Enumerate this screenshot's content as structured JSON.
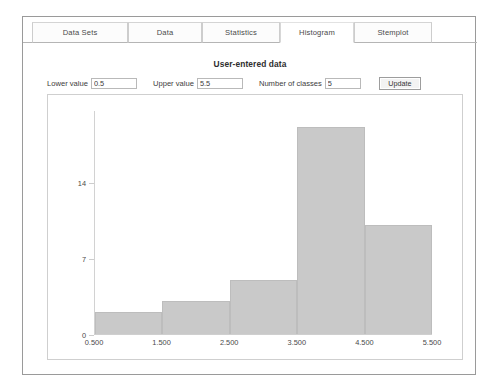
{
  "window": {
    "title": ""
  },
  "tabs": [
    {
      "label": "Data Sets",
      "active": false
    },
    {
      "label": "Data",
      "active": false
    },
    {
      "label": "Statistics",
      "active": false
    },
    {
      "label": "Histogram",
      "active": true
    },
    {
      "label": "Stemplot",
      "active": false
    }
  ],
  "panel": {
    "title": "User-entered data"
  },
  "controls": {
    "lower_label": "Lower value",
    "lower_value": "0.5",
    "upper_label": "Upper value",
    "upper_value": "5.5",
    "classes_label": "Number of classes",
    "classes_value": "5",
    "update_label": "Update"
  },
  "colors": {
    "bar_fill": "#c9c9c9",
    "bar_border": "#bdbdbd",
    "axis": "#cfcfcf",
    "frame": "#9a9a9a",
    "panel_border": "#cfcfcf",
    "text": "#3a3a3a"
  },
  "chart_data": {
    "type": "bar",
    "title": "User-entered data",
    "xlabel": "",
    "ylabel": "",
    "categories": [
      "0.500-1.500",
      "1.500-2.500",
      "2.500-3.500",
      "3.500-4.500",
      "4.500-5.500"
    ],
    "bin_edges": [
      0.5,
      1.5,
      2.5,
      3.5,
      4.5,
      5.5
    ],
    "values": [
      2,
      3,
      5,
      19,
      10
    ],
    "xtick_labels": [
      "0.500",
      "1.500",
      "2.500",
      "3.500",
      "4.500",
      "5.500"
    ],
    "ytick_labels": [
      "0",
      "7",
      "14"
    ],
    "yticks": [
      0,
      7,
      14
    ],
    "xlim": [
      0.5,
      5.5
    ],
    "ylim": [
      0,
      20.6
    ],
    "grid": false,
    "legend": false
  }
}
